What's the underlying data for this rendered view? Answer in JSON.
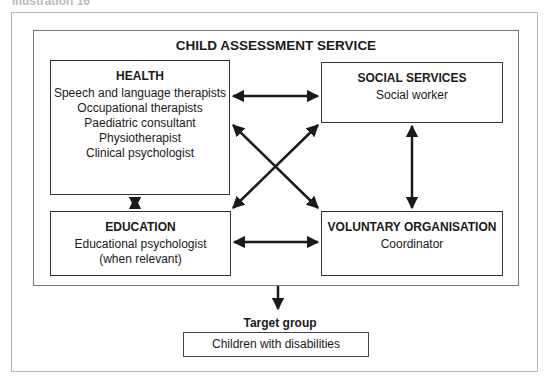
{
  "caption": "Illustration 16",
  "service": {
    "title": "CHILD ASSESSMENT SERVICE"
  },
  "boxes": {
    "health": {
      "heading": "HEALTH",
      "lines": [
        "Speech and language therapists",
        "Occupational therapists",
        "Paediatric consultant",
        "Physiotherapist",
        "Clinical psychologist"
      ]
    },
    "social": {
      "heading": "SOCIAL SERVICES",
      "lines": [
        "Social worker"
      ]
    },
    "education": {
      "heading": "EDUCATION",
      "lines": [
        "Educational psychologist",
        "(when relevant)"
      ]
    },
    "voluntary": {
      "heading": "VOLUNTARY ORGANISATION",
      "lines": [
        "Coordinator"
      ]
    }
  },
  "connections": [
    {
      "from": "health",
      "to": "social",
      "type": "bidirectional"
    },
    {
      "from": "health",
      "to": "education",
      "type": "bidirectional"
    },
    {
      "from": "health",
      "to": "voluntary",
      "type": "bidirectional"
    },
    {
      "from": "social",
      "to": "education",
      "type": "bidirectional"
    },
    {
      "from": "social",
      "to": "voluntary",
      "type": "bidirectional"
    },
    {
      "from": "education",
      "to": "voluntary",
      "type": "bidirectional"
    },
    {
      "from": "service",
      "to": "target_group",
      "type": "directed"
    }
  ],
  "target_group": {
    "label": "Target group",
    "value": "Children with disabilities"
  }
}
